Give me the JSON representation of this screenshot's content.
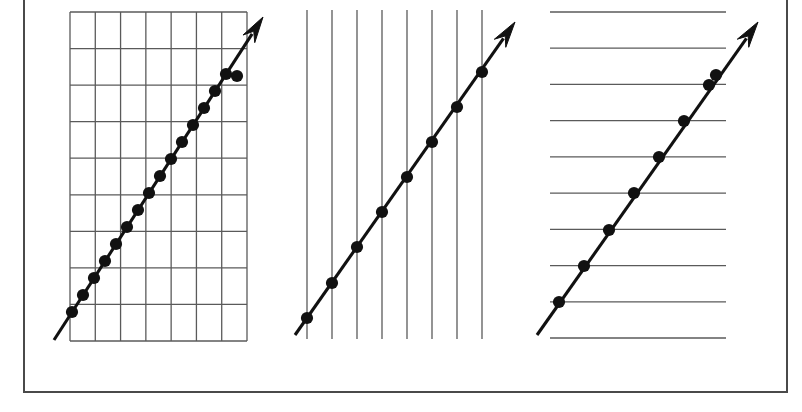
{
  "figure": {
    "width": 802,
    "height": 412,
    "background_color": "#ffffff",
    "border_color": "#4a4a4a",
    "gridline_color": "#5a5a5a",
    "trendline_color": "#111111",
    "dot_color": "#111111",
    "border": {
      "x": 23,
      "y": -6,
      "width": 764,
      "height": 398
    }
  },
  "chart_data": [
    {
      "id": "panel-1",
      "type": "line",
      "title": "",
      "xlabel": "",
      "ylabel": "",
      "grid": "both",
      "grid_vertical_count": 8,
      "grid_horizontal_count": 10,
      "grid_box": {
        "x0": 70,
        "y0": 12,
        "x1": 247,
        "y1": 341
      },
      "legend": "none",
      "series": [
        {
          "name": "trend",
          "marker": "filled-circle",
          "marker_count": 16,
          "arrow": true,
          "line_start": {
            "x": 54,
            "y": 340
          },
          "line_end": {
            "x": 263,
            "y": 17
          },
          "points": [
            {
              "x": 72,
              "y": 312
            },
            {
              "x": 83,
              "y": 295
            },
            {
              "x": 94,
              "y": 278
            },
            {
              "x": 105,
              "y": 261
            },
            {
              "x": 116,
              "y": 244
            },
            {
              "x": 127,
              "y": 227
            },
            {
              "x": 138,
              "y": 210
            },
            {
              "x": 149,
              "y": 193
            },
            {
              "x": 160,
              "y": 176
            },
            {
              "x": 171,
              "y": 159
            },
            {
              "x": 182,
              "y": 142
            },
            {
              "x": 193,
              "y": 125
            },
            {
              "x": 204,
              "y": 108
            },
            {
              "x": 215,
              "y": 91
            },
            {
              "x": 226,
              "y": 74
            },
            {
              "x": 237,
              "y": 76
            }
          ]
        }
      ]
    },
    {
      "id": "panel-2",
      "type": "line",
      "title": "",
      "xlabel": "",
      "ylabel": "",
      "grid": "vertical-only",
      "grid_vertical_count": 8,
      "grid_horizontal_count": 0,
      "grid_box": {
        "x0": 307,
        "y0": 10,
        "x1": 482,
        "y1": 339
      },
      "legend": "none",
      "series": [
        {
          "name": "trend",
          "marker": "filled-circle",
          "marker_count": 8,
          "arrow": true,
          "line_start": {
            "x": 295,
            "y": 335
          },
          "line_end": {
            "x": 515,
            "y": 22
          },
          "points": [
            {
              "x": 307,
              "y": 318
            },
            {
              "x": 332,
              "y": 283
            },
            {
              "x": 357,
              "y": 247
            },
            {
              "x": 382,
              "y": 212
            },
            {
              "x": 407,
              "y": 177
            },
            {
              "x": 432,
              "y": 142
            },
            {
              "x": 457,
              "y": 107
            },
            {
              "x": 482,
              "y": 72
            }
          ]
        }
      ]
    },
    {
      "id": "panel-3",
      "type": "line",
      "title": "",
      "xlabel": "",
      "ylabel": "",
      "grid": "horizontal-only",
      "grid_vertical_count": 0,
      "grid_horizontal_count": 10,
      "grid_box": {
        "x0": 550,
        "y0": 12,
        "x1": 726,
        "y1": 338
      },
      "legend": "none",
      "series": [
        {
          "name": "trend",
          "marker": "filled-circle",
          "marker_count": 8,
          "arrow": true,
          "line_start": {
            "x": 537,
            "y": 335
          },
          "line_end": {
            "x": 758,
            "y": 22
          },
          "points": [
            {
              "x": 559,
              "y": 302
            },
            {
              "x": 584,
              "y": 266
            },
            {
              "x": 609,
              "y": 230
            },
            {
              "x": 634,
              "y": 193
            },
            {
              "x": 659,
              "y": 157
            },
            {
              "x": 684,
              "y": 121
            },
            {
              "x": 709,
              "y": 85
            },
            {
              "x": 716,
              "y": 75
            }
          ]
        }
      ]
    }
  ]
}
